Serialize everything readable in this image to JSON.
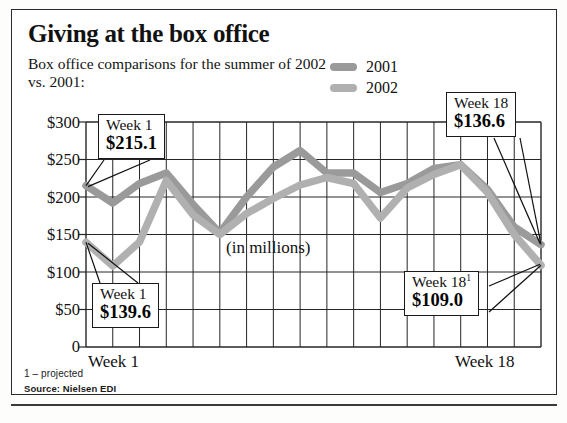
{
  "headline": "Giving at the box office",
  "subhead": "Box office comparisons for the summer of 2002 vs. 2001:",
  "legend": {
    "items": [
      {
        "label": "2001",
        "color": "#9a9a9a"
      },
      {
        "label": "2002",
        "color": "#b0b0b0"
      }
    ]
  },
  "axis": {
    "y_ticks": [
      "$300",
      "$250",
      "$200",
      "$150",
      "$100",
      "$50",
      "0"
    ],
    "x_left": "Week 1",
    "x_right": "Week 18",
    "units_note": "(in millions)"
  },
  "callouts": [
    {
      "id": "w1-2001",
      "week": "Week 1",
      "value": "$215.1",
      "footnote": ""
    },
    {
      "id": "w1-2002",
      "week": "Week 1",
      "value": "$139.6",
      "footnote": ""
    },
    {
      "id": "w18-2001",
      "week": "Week 18",
      "value": "$136.6",
      "footnote": ""
    },
    {
      "id": "w18-2002",
      "week": "Week 18",
      "value": "$109.0",
      "footnote": "1"
    }
  ],
  "footer": {
    "note": "1 – projected",
    "source": "Source: Nielsen EDI"
  },
  "chart_data": {
    "type": "line",
    "title": "Giving at the box office",
    "subtitle": "Box office comparisons for the summer of 2002 vs. 2001:",
    "xlabel": "",
    "ylabel": "",
    "units": "(in millions)",
    "grid": true,
    "legend_position": "top-right",
    "ylim": [
      0,
      300
    ],
    "yticks": [
      0,
      50,
      100,
      150,
      200,
      250,
      300
    ],
    "x": [
      "Week 1",
      "Week 2",
      "Week 3",
      "Week 4",
      "Week 5",
      "Week 6",
      "Week 7",
      "Week 8",
      "Week 9",
      "Week 10",
      "Week 11",
      "Week 12",
      "Week 13",
      "Week 14",
      "Week 15",
      "Week 16",
      "Week 17",
      "Week 18"
    ],
    "categories": [
      "Week 1",
      "Week 2",
      "Week 3",
      "Week 4",
      "Week 5",
      "Week 6",
      "Week 7",
      "Week 8",
      "Week 9",
      "Week 10",
      "Week 11",
      "Week 12",
      "Week 13",
      "Week 14",
      "Week 15",
      "Week 16",
      "Week 17",
      "Week 18"
    ],
    "series": [
      {
        "name": "2001",
        "color": "#9a9a9a",
        "values": [
          215.1,
          192.0,
          218.0,
          232.0,
          190.0,
          152.0,
          200.0,
          240.0,
          262.0,
          232.0,
          232.0,
          206.0,
          218.0,
          238.0,
          243.0,
          210.0,
          160.0,
          136.6
        ]
      },
      {
        "name": "2002",
        "color": "#b0b0b0",
        "values": [
          139.6,
          108.0,
          140.0,
          222.0,
          176.0,
          150.0,
          178.0,
          198.0,
          216.0,
          226.0,
          218.0,
          172.0,
          212.0,
          230.0,
          243.0,
          206.0,
          150.0,
          109.0
        ]
      }
    ],
    "annotations": [
      {
        "series": "2001",
        "point": "Week 1",
        "label": "Week 1",
        "value": 215.1
      },
      {
        "series": "2002",
        "point": "Week 1",
        "label": "Week 1",
        "value": 139.6
      },
      {
        "series": "2001",
        "point": "Week 18",
        "label": "Week 18",
        "value": 136.6
      },
      {
        "series": "2002",
        "point": "Week 18",
        "label": "Week 18¹",
        "value": 109.0
      }
    ],
    "source": "Source: Nielsen EDI",
    "footnote": "1 – projected"
  }
}
